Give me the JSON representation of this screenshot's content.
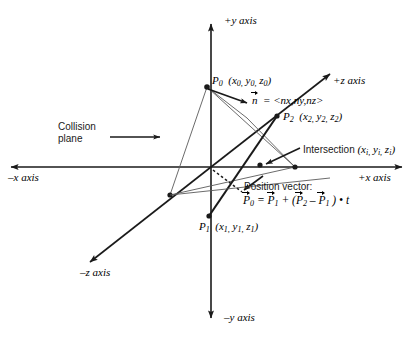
{
  "figure": {
    "background": "#ffffff",
    "line_color": "#1a1a1a"
  },
  "axes": {
    "y_positive": "+y axis",
    "y_negative": "–y axis",
    "x_positive": "+x axis",
    "x_negative": "–x axis",
    "z_positive": "+z axis",
    "z_negative": "–z axis",
    "origin_label": ""
  },
  "labels": {
    "p0_name": "P",
    "p0_sub": "0",
    "p0_coords": "(x",
    "p0_full": "P",
    "collision_plane_line1": "Collision",
    "collision_plane_line2": "plane",
    "intersection": "Intersection",
    "position_vector_caption": "Position vector:",
    "normal_lhs": "n",
    "normal_eq": " = <nx,ny,nz>"
  },
  "points": [
    {
      "id": "P0",
      "name": "P",
      "sub": "0",
      "coords": "(x0, y0, z0)",
      "x": 207,
      "y": 87
    },
    {
      "id": "P1",
      "name": "P",
      "sub": "1",
      "coords": "(x1, y1, z1)",
      "x": 209,
      "y": 216
    },
    {
      "id": "P2",
      "name": "P",
      "sub": "2",
      "coords": "(x2, y2, z2)",
      "x": 277,
      "y": 116
    },
    {
      "id": "Pi",
      "name": "Intersection",
      "sub": "i",
      "coords": "(xi, yi, zi)",
      "x": 260,
      "y": 165
    }
  ],
  "equations": {
    "normal": "n = <nx,ny,nz>",
    "position_vector": "P0 = P1 + (P2 - P1) • t"
  },
  "colors": {
    "stroke": "#1a1a1a",
    "thin_stroke": "#555555",
    "text": "#000000"
  }
}
